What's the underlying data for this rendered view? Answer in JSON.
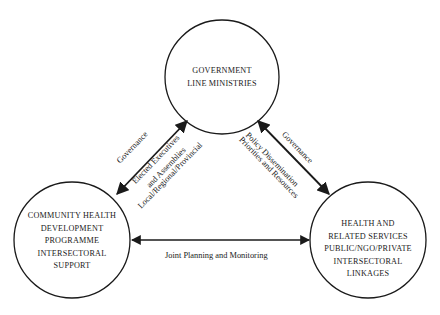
{
  "nodes": {
    "government": {
      "lines": [
        "GOVERNMENT",
        "LINE MINISTRIES"
      ]
    },
    "community": {
      "lines": [
        "COMMUNITY HEALTH",
        "DEVELOPMENT",
        "PROGRAMME",
        "INTERSECTORAL",
        "SUPPORT"
      ]
    },
    "health": {
      "lines": [
        "HEALTH AND",
        "RELATED SERVICES",
        "PUBLIC/NGO/PRIVATE",
        "INTERSECTORAL",
        "LINKAGES"
      ]
    }
  },
  "edges": {
    "gov_community": {
      "outer_label": "Governance",
      "inner_labels": [
        "Elected Executives",
        "and Assemblies",
        "Local/Regional/Provincial"
      ]
    },
    "gov_health": {
      "outer_label": "Governance",
      "inner_labels": [
        "Policy Dissemination",
        "Priorities and Resources"
      ]
    },
    "community_health": {
      "label": "Joint Planning and Monitoring"
    }
  },
  "colors": {
    "stroke": "#1a1a1a",
    "background": "#ffffff"
  }
}
